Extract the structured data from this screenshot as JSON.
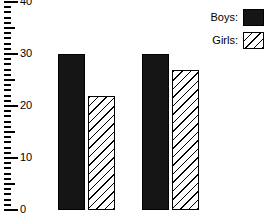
{
  "chart_data": {
    "type": "bar",
    "title": "",
    "subtitle": "",
    "xlabel": "",
    "ylabel": "",
    "ylim": [
      0,
      40
    ],
    "grid": false,
    "legend_position": "right",
    "categories": [
      "Group 1",
      "Group 2"
    ],
    "y_ticks": [
      0,
      10,
      20,
      30,
      40
    ],
    "y_tick_labels": [
      "0",
      "10",
      "20",
      "30",
      "40"
    ],
    "minor_tick_step": 1,
    "series": [
      {
        "name": "Boys:",
        "values": [
          30,
          30
        ],
        "fill": "solid",
        "color": "#151515"
      },
      {
        "name": "Girls:",
        "values": [
          22,
          27
        ],
        "fill": "hatch",
        "color": "#ffffff"
      }
    ],
    "annotations": []
  },
  "axis": {
    "labels": {
      "t0": "0",
      "t10": "10",
      "t20": "20",
      "t30": "30",
      "t40": "40"
    }
  },
  "legend": {
    "items": [
      {
        "label": "Boys:",
        "swatch": "solid-black-swatch"
      },
      {
        "label": "Girls:",
        "swatch": "hatched-swatch"
      }
    ]
  }
}
